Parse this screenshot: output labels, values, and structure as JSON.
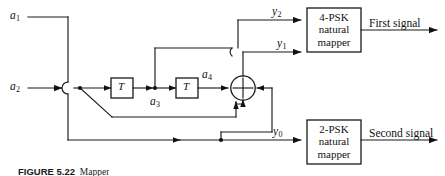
{
  "figure": {
    "caption_label": "FIGURE 5.22",
    "caption_text": "Mapper"
  },
  "inputs": [
    {
      "name": "a1",
      "base": "a",
      "sub": "1"
    },
    {
      "name": "a2",
      "base": "a",
      "sub": "2"
    }
  ],
  "internal_signals": [
    {
      "name": "a3",
      "base": "a",
      "sub": "3"
    },
    {
      "name": "a4",
      "base": "a",
      "sub": "4"
    }
  ],
  "outputs_to_mappers": [
    {
      "name": "y2",
      "base": "y",
      "sub": "2"
    },
    {
      "name": "y1",
      "base": "y",
      "sub": "1"
    },
    {
      "name": "y0",
      "base": "y",
      "sub": "0"
    }
  ],
  "delay_blocks": [
    {
      "label": "T"
    },
    {
      "label": "T"
    }
  ],
  "adder": {
    "symbol": "modulo-adder",
    "glyph": "+"
  },
  "mappers": [
    {
      "id": "four-psk",
      "line1": "4-PSK",
      "line2": "natural",
      "line3": "mapper",
      "output_label": "First signal"
    },
    {
      "id": "two-psk",
      "line1": "2-PSK",
      "line2": "natural",
      "line3": "mapper",
      "output_label": "Second signal"
    }
  ],
  "colors": {
    "ink": "#1a1a1a",
    "background": "#ffffff"
  }
}
